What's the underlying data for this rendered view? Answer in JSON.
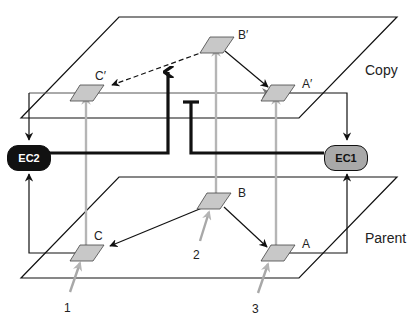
{
  "diagram": {
    "planes": {
      "copy": {
        "label": "Copy"
      },
      "parent": {
        "label": "Parent"
      }
    },
    "nodes": {
      "copy_c": {
        "label": "C′"
      },
      "copy_b": {
        "label": "B′"
      },
      "copy_a": {
        "label": "A′"
      },
      "parent_c": {
        "label": "C"
      },
      "parent_b": {
        "label": "B"
      },
      "parent_a": {
        "label": "A"
      }
    },
    "controllers": {
      "ec2": {
        "label": "EC2",
        "fill": "#111111",
        "text_color": "#ffffff"
      },
      "ec1": {
        "label": "EC1",
        "fill": "#a9a9a9",
        "text_color": "#111111"
      }
    },
    "inputs": [
      {
        "label": "1"
      },
      {
        "label": "2"
      },
      {
        "label": "3"
      }
    ],
    "colors": {
      "line": "#111111",
      "copy_arrow": "#b5b5b5",
      "node_fill": "#c8c8c8"
    }
  }
}
